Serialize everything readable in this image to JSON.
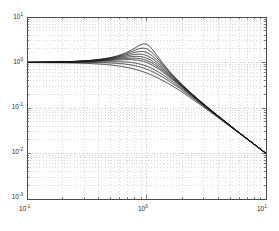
{
  "figure": {
    "title": "",
    "background_color": "#ffffff",
    "frame_color": "#4a4a4a",
    "curve_color": "#1a1a1a",
    "grid_color": "#b4b4b4"
  },
  "axes": {
    "x_tick_labels": [
      {
        "mantissa": "10",
        "exponent": "-1",
        "value": 0.1
      },
      {
        "mantissa": "10",
        "exponent": "0",
        "value": 1
      },
      {
        "mantissa": "10",
        "exponent": "1",
        "value": 10
      }
    ],
    "y_tick_labels": [
      {
        "mantissa": "10",
        "exponent": "1",
        "value": 10
      },
      {
        "mantissa": "10",
        "exponent": "0",
        "value": 1
      },
      {
        "mantissa": "10",
        "exponent": "-1",
        "value": 0.1
      },
      {
        "mantissa": "10",
        "exponent": "-2",
        "value": 0.01
      },
      {
        "mantissa": "10",
        "exponent": "-3",
        "value": 0.001
      }
    ]
  },
  "chart_data": {
    "type": "line",
    "title": "",
    "xlabel": "",
    "ylabel": "",
    "xscale": "log",
    "yscale": "log",
    "xlim": [
      0.1,
      10
    ],
    "ylim": [
      0.001,
      10
    ],
    "grid": true,
    "grid_style": "dotted",
    "minor_grid": true,
    "legend": "none",
    "x": [
      0.1,
      0.126,
      0.158,
      0.2,
      0.251,
      0.316,
      0.398,
      0.501,
      0.631,
      0.794,
      0.891,
      0.955,
      1.0,
      1.047,
      1.122,
      1.259,
      1.585,
      2.0,
      2.512,
      3.162,
      3.981,
      5.012,
      6.31,
      7.943,
      10.0
    ],
    "series": [
      {
        "name": "zeta=0.20",
        "zeta": 0.2,
        "peak": 2.55,
        "values": [
          1.01,
          1.016,
          1.026,
          1.042,
          1.068,
          1.113,
          1.195,
          1.35,
          1.68,
          2.28,
          2.52,
          2.54,
          2.5,
          2.35,
          1.92,
          1.32,
          0.71,
          0.41,
          0.225,
          0.12,
          0.0664,
          0.0408,
          0.0255,
          0.0159,
          0.0101
        ]
      },
      {
        "name": "zeta=0.25",
        "zeta": 0.25,
        "peak": 2.07,
        "values": [
          1.01,
          1.015,
          1.024,
          1.039,
          1.063,
          1.103,
          1.175,
          1.305,
          1.56,
          1.93,
          2.04,
          2.06,
          2.0,
          1.93,
          1.66,
          1.22,
          0.69,
          0.4,
          0.223,
          0.119,
          0.0662,
          0.0407,
          0.0254,
          0.0159,
          0.0101
        ]
      },
      {
        "name": "zeta=0.30",
        "zeta": 0.3,
        "peak": 1.75,
        "values": [
          1.009,
          1.014,
          1.022,
          1.035,
          1.057,
          1.092,
          1.153,
          1.258,
          1.45,
          1.69,
          1.74,
          1.75,
          1.67,
          1.63,
          1.46,
          1.13,
          0.675,
          0.395,
          0.221,
          0.118,
          0.0659,
          0.0406,
          0.0254,
          0.0159,
          0.0101
        ]
      },
      {
        "name": "zeta=0.35",
        "zeta": 0.35,
        "peak": 1.52,
        "values": [
          1.008,
          1.012,
          1.019,
          1.031,
          1.05,
          1.079,
          1.13,
          1.212,
          1.35,
          1.49,
          1.51,
          1.52,
          1.43,
          1.4,
          1.29,
          1.05,
          0.655,
          0.39,
          0.219,
          0.117,
          0.0657,
          0.0405,
          0.0253,
          0.0159,
          0.01
        ]
      },
      {
        "name": "zeta=0.40",
        "zeta": 0.4,
        "peak": 1.36,
        "values": [
          1.007,
          1.01,
          1.016,
          1.026,
          1.042,
          1.066,
          1.106,
          1.168,
          1.26,
          1.34,
          1.35,
          1.36,
          1.25,
          1.23,
          1.15,
          0.97,
          0.63,
          0.383,
          0.217,
          0.117,
          0.0654,
          0.0404,
          0.0253,
          0.0158,
          0.01
        ]
      },
      {
        "name": "zeta=0.45",
        "zeta": 0.45,
        "peak": 1.24,
        "values": [
          1.006,
          1.008,
          1.013,
          1.021,
          1.034,
          1.052,
          1.082,
          1.127,
          1.185,
          1.22,
          1.23,
          1.24,
          1.11,
          1.1,
          1.04,
          0.9,
          0.61,
          0.377,
          0.215,
          0.116,
          0.0651,
          0.0403,
          0.0252,
          0.0158,
          0.01
        ]
      },
      {
        "name": "zeta=0.50",
        "zeta": 0.5,
        "peak": 1.155,
        "values": [
          1.005,
          1.006,
          1.01,
          1.016,
          1.025,
          1.038,
          1.059,
          1.088,
          1.12,
          1.14,
          1.15,
          1.155,
          1.0,
          0.99,
          0.95,
          0.84,
          0.585,
          0.37,
          0.213,
          0.115,
          0.0649,
          0.0402,
          0.0252,
          0.0158,
          0.01
        ]
      },
      {
        "name": "zeta=0.60",
        "zeta": 0.6,
        "peak": 1.042,
        "values": [
          1.003,
          1.003,
          1.005,
          1.007,
          1.011,
          1.016,
          1.022,
          1.028,
          1.033,
          1.04,
          1.042,
          1.04,
          0.833,
          0.83,
          0.8,
          0.73,
          0.54,
          0.355,
          0.209,
          0.114,
          0.0644,
          0.04,
          0.0251,
          0.0158,
          0.01
        ]
      },
      {
        "name": "zeta=0.70",
        "zeta": 0.7,
        "peak": 1.003,
        "values": [
          1.0,
          1.0,
          1.0,
          0.999,
          0.998,
          0.996,
          0.992,
          0.986,
          0.978,
          0.965,
          0.955,
          0.945,
          0.714,
          0.71,
          0.69,
          0.645,
          0.495,
          0.337,
          0.203,
          0.112,
          0.0638,
          0.0398,
          0.025,
          0.0157,
          0.01
        ]
      },
      {
        "name": "zeta=0.85",
        "zeta": 0.85,
        "peak": 1.0,
        "values": [
          0.997,
          0.996,
          0.993,
          0.989,
          0.983,
          0.973,
          0.958,
          0.935,
          0.9,
          0.85,
          0.82,
          0.8,
          0.588,
          0.584,
          0.572,
          0.545,
          0.44,
          0.313,
          0.195,
          0.109,
          0.0629,
          0.0394,
          0.0249,
          0.0157,
          0.00999
        ]
      }
    ]
  }
}
